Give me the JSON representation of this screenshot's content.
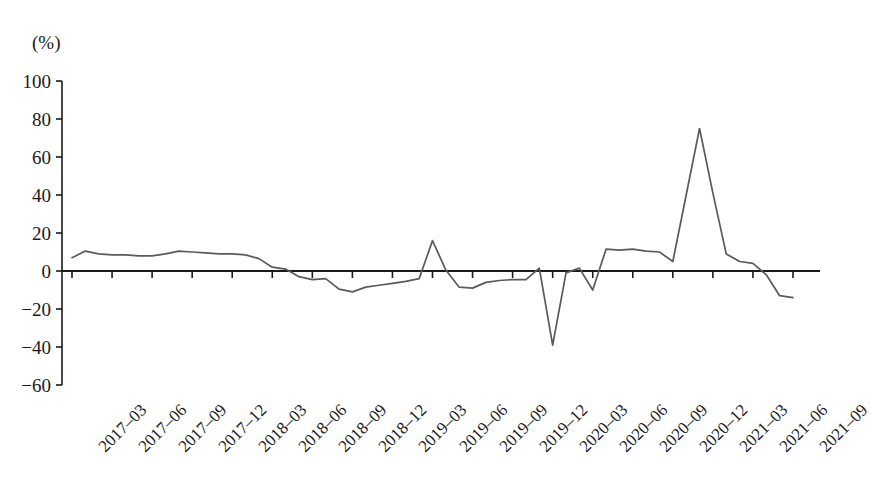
{
  "chart_data": {
    "type": "line",
    "title": "",
    "subtitle": "",
    "xlabel": "",
    "ylabel": "",
    "unit_label": "(%)",
    "grid": false,
    "legend": null,
    "ylim": [
      -60,
      100
    ],
    "ytick_values": [
      100,
      80,
      60,
      40,
      20,
      0,
      -20,
      -40,
      -60
    ],
    "ytick_labels": [
      "100",
      "80",
      "60",
      "40",
      "20",
      "0",
      "−20",
      "−40",
      "−60"
    ],
    "zero_line": 0,
    "categories": [
      "2017-03",
      "2017-06",
      "2017-09",
      "2017-12",
      "2018-03",
      "2018-06",
      "2018-09",
      "2018-12",
      "2019-03",
      "2019-06",
      "2019-09",
      "2019-12",
      "2020-03",
      "2020-06",
      "2020-09",
      "2020-12",
      "2021-03",
      "2021-06",
      "2021-09"
    ],
    "xtick_labels": [
      "2017‒03",
      "2017‒06",
      "2017‒09",
      "2017‒12",
      "2018‒03",
      "2018‒06",
      "2018‒09",
      "2018‒12",
      "2019‒03",
      "2019‒06",
      "2019‒09",
      "2019‒12",
      "2020‒03",
      "2020‒06",
      "2020‒09",
      "2020‒12",
      "2021‒03",
      "2021‒06",
      "2021‒09"
    ],
    "series": [
      {
        "name": "series-1",
        "color": "#5a5a5a",
        "x": [
          "2017-03",
          "2017-04",
          "2017-05",
          "2017-06",
          "2017-07",
          "2017-08",
          "2017-09",
          "2017-10",
          "2017-11",
          "2017-12",
          "2018-01",
          "2018-02",
          "2018-03",
          "2018-04",
          "2018-05",
          "2018-06",
          "2018-07",
          "2018-08",
          "2018-09",
          "2018-10",
          "2018-11",
          "2018-12",
          "2019-01",
          "2019-02",
          "2019-03",
          "2019-04",
          "2019-05",
          "2019-06",
          "2019-07",
          "2019-08",
          "2019-09",
          "2019-10",
          "2019-11",
          "2019-12",
          "2020-01",
          "2020-02",
          "2020-03",
          "2020-04",
          "2020-05",
          "2020-06",
          "2020-07",
          "2020-08",
          "2020-09",
          "2020-10",
          "2020-11",
          "2020-12",
          "2021-01",
          "2021-02",
          "2021-03",
          "2021-04",
          "2021-05",
          "2021-06",
          "2021-07",
          "2021-08",
          "2021-09"
        ],
        "values": [
          7.0,
          10.5,
          9.0,
          8.5,
          8.5,
          8.0,
          8.0,
          9.0,
          10.5,
          10.0,
          9.5,
          9.0,
          9.0,
          8.5,
          6.5,
          2.0,
          1.0,
          -3.0,
          -4.5,
          -4.0,
          -9.5,
          -11.0,
          -8.5,
          -7.5,
          -6.5,
          -5.5,
          -4.0,
          16.0,
          0.5,
          -8.5,
          -9.0,
          -6.0,
          -5.0,
          -4.5,
          -4.5,
          1.5,
          -39.0,
          -1.0,
          1.5,
          -10.0,
          11.5,
          11.0,
          11.5,
          10.5,
          10.0,
          5.0,
          40.0,
          75.0,
          41.0,
          9.0,
          5.0,
          4.0,
          -2.0,
          -13.0,
          -14.0
        ]
      }
    ]
  },
  "axes": {
    "x_axis_name": "time-axis",
    "y_axis_name": "percent-axis"
  }
}
